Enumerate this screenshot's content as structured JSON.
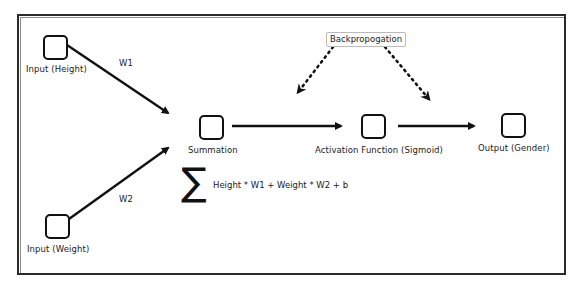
{
  "diagram": {
    "type": "neural-network-perceptron",
    "nodes": [
      {
        "id": "input_height",
        "label": "Input (Height)"
      },
      {
        "id": "input_weight",
        "label": "Input (Weight)"
      },
      {
        "id": "summation",
        "label": "Summation"
      },
      {
        "id": "activation",
        "label": "Activation Function (Sigmoid)"
      },
      {
        "id": "output",
        "label": "Output (Gender)"
      }
    ],
    "edges": [
      {
        "from": "input_height",
        "to": "summation",
        "label": "W1",
        "style": "solid"
      },
      {
        "from": "input_weight",
        "to": "summation",
        "label": "W2",
        "style": "solid"
      },
      {
        "from": "summation",
        "to": "activation",
        "label": "",
        "style": "solid"
      },
      {
        "from": "activation",
        "to": "output",
        "label": "",
        "style": "solid"
      }
    ],
    "backprop": {
      "label": "Backpropogation",
      "style": "dotted",
      "targets": [
        "summation-to-activation",
        "activation-to-output"
      ]
    },
    "formula": {
      "symbol": "∑",
      "text": "Height * W1 + Weight * W2 + b"
    }
  }
}
